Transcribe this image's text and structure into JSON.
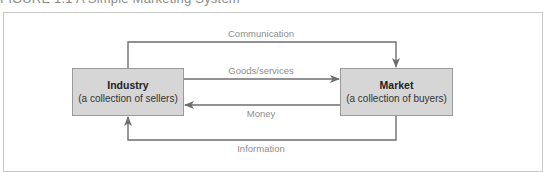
{
  "figure": {
    "title": "FIGURE 1.1 A Simple Marketing System"
  },
  "nodes": [
    {
      "id": "industry",
      "name": "Industry",
      "description": "(a collection of sellers)"
    },
    {
      "id": "market",
      "name": "Market",
      "description": "(a collection of buyers)"
    }
  ],
  "flows": [
    {
      "id": "communication",
      "label": "Communication",
      "from": "industry",
      "to": "market"
    },
    {
      "id": "goods",
      "label": "Goods/services",
      "from": "industry",
      "to": "market"
    },
    {
      "id": "money",
      "label": "Money",
      "from": "market",
      "to": "industry"
    },
    {
      "id": "information",
      "label": "Information",
      "from": "market",
      "to": "industry"
    }
  ],
  "colors": {
    "box_fill": "#d6d6d6",
    "box_border": "#9a9a9a",
    "arrow": "#6e6e6e",
    "label": "#8e8e8e",
    "frame": "#c8c8c8"
  }
}
